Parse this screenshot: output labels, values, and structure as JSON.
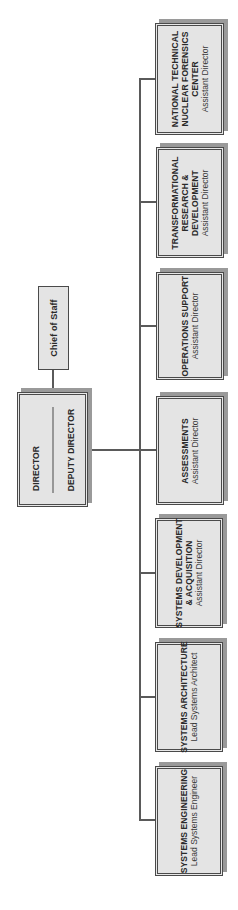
{
  "chart_title": "",
  "orientation": "rotated 90° counter-clockwise",
  "top": {
    "chief_of_staff": {
      "title": "Chief of Staff"
    },
    "director": {
      "title": "DIRECTOR",
      "deputy": "DEPUTY DIRECTOR"
    }
  },
  "units": [
    {
      "title_lines": [
        "NATIONAL TECHNICAL",
        "NUCLEAR FORENSICS",
        "CENTER"
      ],
      "role": "Assistant Director"
    },
    {
      "title_lines": [
        "TRANSFORMATIONAL",
        "RESEARCH &",
        "DEVELOPMENT"
      ],
      "role": "Assistant Director"
    },
    {
      "title_lines": [
        "OPERATIONS SUPPORT"
      ],
      "role": "Assistant Director"
    },
    {
      "title_lines": [
        "ASSESSMENTS"
      ],
      "role": "Assistant Director"
    },
    {
      "title_lines": [
        "SYSTEMS DEVELOPMENT",
        "& ACQUISITION"
      ],
      "role": "Assistant Director"
    },
    {
      "title_lines": [
        "SYSTEMS ARCHITECTURE"
      ],
      "role": "Lead Systems Architect"
    },
    {
      "title_lines": [
        "SYSTEMS ENGINEERING"
      ],
      "role": "Lead Systems Engineer"
    }
  ],
  "colors": {
    "box_fill": "#e4e4e4",
    "border": "#4a4a4a",
    "shadow": "#9a9a9a",
    "line": "#5a5a5a"
  }
}
